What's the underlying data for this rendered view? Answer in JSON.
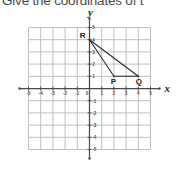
{
  "question": {
    "text": "Give the coordinates of t"
  },
  "plot": {
    "axis_labels": {
      "x": "x",
      "y": "y"
    },
    "x_ticks": [
      "-5",
      "-4",
      "-3",
      "-2",
      "-1",
      "0",
      "1",
      "2",
      "3",
      "4",
      "5"
    ],
    "y_ticks": [
      "5",
      "4",
      "3",
      "2",
      "1",
      "-1",
      "-2",
      "-3",
      "-4",
      "-5"
    ],
    "origin_label": "0",
    "points": [
      {
        "label": "P",
        "x": 2,
        "y": 1
      },
      {
        "label": "Q",
        "x": 4,
        "y": 1
      },
      {
        "label": "R",
        "x": 0,
        "y": 4
      }
    ],
    "colors": {
      "grid": "#b9b9b9",
      "axis": "#4a4a4a",
      "shape": "#2b2b2b",
      "text": "#4a4a4a"
    }
  },
  "chart_data": {
    "type": "scatter",
    "title": "Give the coordinates of t",
    "xlabel": "x",
    "ylabel": "y",
    "xlim": [
      -5,
      5
    ],
    "ylim": [
      -5,
      5
    ],
    "xticks": [
      -5,
      -4,
      -3,
      -2,
      -1,
      0,
      1,
      2,
      3,
      4,
      5
    ],
    "yticks": [
      -5,
      -4,
      -3,
      -2,
      -1,
      1,
      2,
      3,
      4,
      5
    ],
    "grid": true,
    "legend": "none",
    "series": [
      {
        "name": "Triangle PQR",
        "points": [
          {
            "label": "P",
            "x": 2,
            "y": 1
          },
          {
            "label": "Q",
            "x": 4,
            "y": 1
          },
          {
            "label": "R",
            "x": 0,
            "y": 4
          }
        ],
        "closed": true
      }
    ],
    "annotations": [
      {
        "text": "P",
        "x": 2,
        "y": 1
      },
      {
        "text": "Q",
        "x": 4,
        "y": 1
      },
      {
        "text": "R",
        "x": 0,
        "y": 4
      }
    ]
  }
}
